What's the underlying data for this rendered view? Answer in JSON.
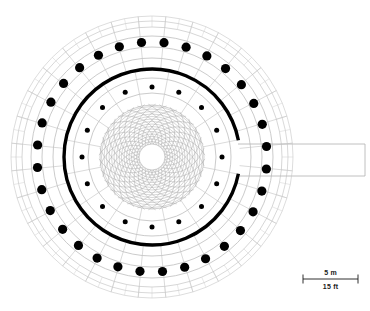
{
  "figure": {
    "kind": "architectural-floor-plan",
    "background_color": "#ffffff",
    "line_color_fine": "#b9b9b9",
    "line_color_mid": "#9a9a9a",
    "line_color_heavy": "#000000",
    "column_color": "#000000"
  },
  "geometry": {
    "center": {
      "x": 152,
      "y": 157
    },
    "units": "pixels",
    "outer_envelope_radius": 141,
    "rings": [
      {
        "name": "outer-edge-ring-1",
        "radius": 141,
        "stroke": "#c6c6c6",
        "width": 0.6
      },
      {
        "name": "outer-edge-ring-2",
        "radius": 136,
        "stroke": "#bfbfbf",
        "width": 0.6
      },
      {
        "name": "outer-edge-ring-3",
        "radius": 130,
        "stroke": "#bababa",
        "width": 0.6
      },
      {
        "name": "ambulatory-outer",
        "radius": 121,
        "stroke": "#b5b5b5",
        "width": 0.7
      },
      {
        "name": "ambulatory-mid",
        "radius": 110,
        "stroke": "#b5b5b5",
        "width": 0.7
      },
      {
        "name": "ambulatory-inner",
        "radius": 99,
        "stroke": "#b5b5b5",
        "width": 0.7
      },
      {
        "name": "drum-wall-thick",
        "radius": 88,
        "stroke": "#000000",
        "width": 3.4
      },
      {
        "name": "nave-ring-outer",
        "radius": 79,
        "stroke": "#b5b5b5",
        "width": 0.7
      },
      {
        "name": "nave-ring-mid",
        "radius": 64,
        "stroke": "#b5b5b5",
        "width": 0.7
      },
      {
        "name": "dome-field-edge",
        "radius": 52,
        "stroke": "#aeaeae",
        "width": 0.6
      },
      {
        "name": "oculus",
        "radius": 13,
        "stroke": "#bdbdbd",
        "width": 0.7
      }
    ]
  },
  "columns": {
    "outer_ring": {
      "name": "peristyle-columns",
      "count": 32,
      "radius": 115,
      "dot_radius": 4.6,
      "color": "#000000",
      "start_angle_deg": -84
    },
    "inner_ring": {
      "name": "dome-support-columns",
      "count": 16,
      "radius": 70,
      "dot_radius": 2.5,
      "color": "#000000",
      "start_angle_deg": -90
    }
  },
  "dome_pattern": {
    "name": "interlacing-spiral-rib-vault",
    "spiral_arms": 30,
    "spiral_turn_deg": 70,
    "ring_steps": 16,
    "inner_radius": 13,
    "outer_radius": 53,
    "stroke": "#a6a6a6",
    "width": 0.45
  },
  "radial_grid": {
    "name": "paving-and-vault-grid",
    "outer_spokes": 32,
    "inner_spokes": 16,
    "stroke": "#bcbcbc",
    "width": 0.55
  },
  "corridor": {
    "name": "axial-entrance-passage",
    "x_start": 278,
    "x_end": 365,
    "y_top": 144,
    "y_bottom": 176,
    "stroke": "#b0b0b0",
    "width": 0.8,
    "wall_gap_half_angle_deg": 11
  },
  "scale_bar": {
    "x_left": 303,
    "x_right": 358,
    "y_rule": 279,
    "tick_height": 9,
    "stroke": "#1a1a1a",
    "metric_label": "5 m",
    "imperial_label": "15 ft",
    "metric_label_y": 275,
    "imperial_label_y": 289
  }
}
